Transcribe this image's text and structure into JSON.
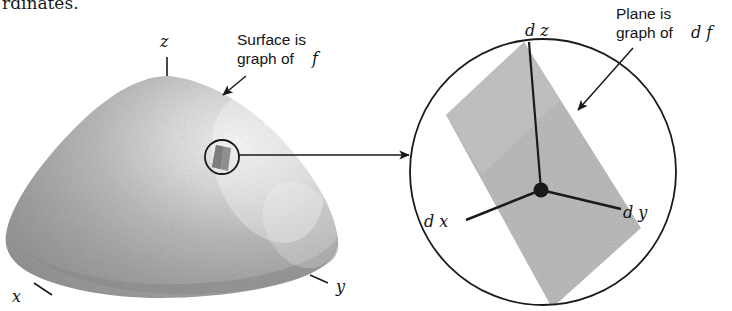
{
  "page": {
    "width": 732,
    "height": 311,
    "background": "#ffffff",
    "cut_off_line_above": "rdinates."
  },
  "colors": {
    "ink": "#1a1a1a",
    "plane_fill": "#bdbdbd",
    "surface_light": "#f0f0f0",
    "surface_mid": "#a8a8a8",
    "surface_dark": "#8e8e8e",
    "patch_fill": "#8a8a8a",
    "background": "#ffffff"
  },
  "left_panel": {
    "name": "surface-graph-of-f",
    "axis_labels": [
      {
        "id": "z",
        "text": "z",
        "x": 165,
        "y": 47
      },
      {
        "id": "x",
        "text": "x",
        "y_pos": 297,
        "x": 16
      },
      {
        "id": "y",
        "text": "y",
        "y_pos": 288,
        "x": 337
      }
    ],
    "callout": {
      "line1": "Surface is",
      "line2_prefix": "graph of",
      "line2_math": "f"
    },
    "magnifier_circle": {
      "cx": 222,
      "cy": 157,
      "r": 17
    }
  },
  "right_panel": {
    "name": "magnified-tangent-plane",
    "circle": {
      "cx": 543,
      "cy": 172,
      "r": 133
    },
    "origin_dot": {
      "cx": 541,
      "cy": 190,
      "r": 7
    },
    "axis_labels": [
      {
        "id": "dz",
        "text": "d z",
        "x": 530,
        "y": 33
      },
      {
        "id": "dx",
        "text": "d x",
        "x": 437,
        "y": 222
      },
      {
        "id": "dy",
        "text": "d y",
        "x": 627,
        "y": 213
      }
    ],
    "callout": {
      "line1": "Plane is",
      "line2_prefix": "graph of",
      "line2_math": "d f"
    }
  },
  "connector": {
    "name": "magnification-arrow",
    "from_x": 239,
    "to_x": 409,
    "y": 155
  }
}
